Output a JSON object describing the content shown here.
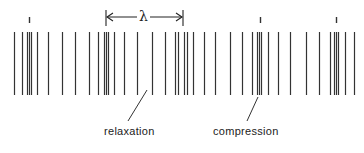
{
  "diagram": {
    "wavelength_symbol": "λ",
    "labels": {
      "relaxation": "relaxation",
      "compression": "compression"
    },
    "line_color": "#333333",
    "line_top": 32,
    "line_bottom": 95,
    "lines_x": [
      14,
      22,
      27,
      29,
      31,
      37,
      48,
      62,
      75,
      89,
      98,
      104,
      106,
      108,
      114,
      124,
      137,
      152,
      165,
      175,
      178,
      184,
      187,
      193,
      204,
      215,
      230,
      242,
      252,
      257,
      259,
      261,
      268,
      278,
      290,
      306,
      319,
      330,
      334,
      336,
      338,
      345,
      354
    ],
    "compression_markers_x": [
      29,
      260,
      336
    ],
    "wavelength_span": {
      "x1": 106,
      "x2": 183,
      "y": 17
    },
    "pointers": [
      {
        "name": "relaxation",
        "x1": 147,
        "y1": 90,
        "x2": 128,
        "y2": 121
      },
      {
        "name": "compression",
        "x1": 258,
        "y1": 97,
        "x2": 247,
        "y2": 121
      }
    ]
  }
}
